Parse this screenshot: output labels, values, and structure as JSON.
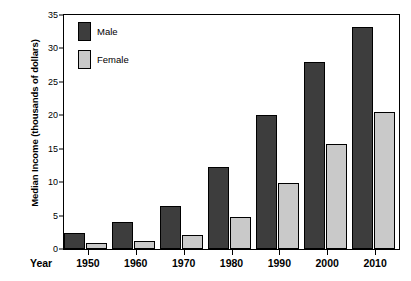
{
  "chart_data": {
    "type": "bar",
    "title": "",
    "subtitle": "",
    "xlabel": "Year",
    "ylabel": "Median Income (thousands of dollars)",
    "categories": [
      "1950",
      "1960",
      "1970",
      "1980",
      "1990",
      "2000",
      "2010"
    ],
    "series": [
      {
        "name": "Male",
        "color": "#3d3d3d",
        "values": [
          2.4,
          4.0,
          6.5,
          12.3,
          20.0,
          28.0,
          33.2
        ]
      },
      {
        "name": "Female",
        "color": "#c9c9c9",
        "values": [
          0.9,
          1.2,
          2.1,
          4.8,
          9.8,
          15.7,
          20.5
        ]
      }
    ],
    "ylim": [
      0,
      35
    ],
    "yticks": [
      0,
      5,
      10,
      15,
      20,
      25,
      30,
      35
    ],
    "ytick_labels": [
      "0",
      "5",
      "10",
      "15",
      "20",
      "25",
      "30",
      "35"
    ],
    "grid": false,
    "legend_position": "top-left-inside",
    "frame": true,
    "annotations": []
  },
  "legend": {
    "entries": [
      {
        "label": "Male"
      },
      {
        "label": "Female"
      }
    ]
  }
}
